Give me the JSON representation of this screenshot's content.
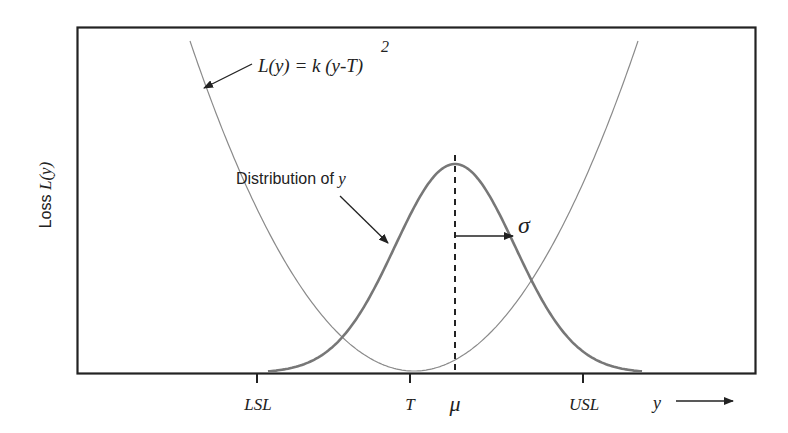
{
  "figure": {
    "y_axis_label_prefix": "Loss ",
    "y_axis_label_var": "L(y)",
    "x_axis_var": "y",
    "loss_formula": "L(y) = k (y-T)",
    "loss_formula_exponent": "2",
    "distribution_label_prefix": "Distribution of ",
    "distribution_label_var": "y",
    "sigma_symbol": "σ",
    "mu_symbol": "μ",
    "ticks": [
      {
        "label": "LSL",
        "meaning": "lower specification limit"
      },
      {
        "label": "T",
        "meaning": "target"
      },
      {
        "label": "USL",
        "meaning": "upper specification limit"
      }
    ]
  },
  "colors": {
    "frame": "#222222",
    "loss_curve": "#888888",
    "distribution_curve": "#777777",
    "arrows": "#222222",
    "text": "#222222"
  },
  "chart_data": {
    "type": "line",
    "title": "",
    "xlabel": "y",
    "ylabel": "Loss L(y)",
    "x_ticks": [
      "LSL",
      "T",
      "μ",
      "USL"
    ],
    "series": [
      {
        "name": "Quadratic loss L(y) = k (y-T)^2",
        "shape": "parabola",
        "vertex": "T"
      },
      {
        "name": "Distribution of y",
        "shape": "normal",
        "mean": "μ",
        "std": "σ"
      }
    ],
    "annotations": [
      "L(y) = k (y-T)^2",
      "Distribution of y",
      "σ",
      "μ (dashed mean line)"
    ],
    "grid": false
  }
}
